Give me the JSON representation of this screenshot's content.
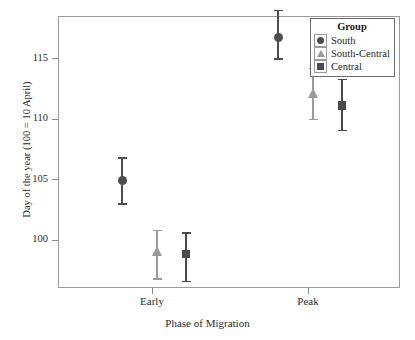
{
  "chart_data": {
    "type": "scatter",
    "title": "",
    "xlabel": "Phase of Migration",
    "ylabel": "Day of the year (100 = 10 April)",
    "categories": [
      "Early",
      "Peak"
    ],
    "xtick_labels": [
      "Early",
      "Peak"
    ],
    "ytick_labels": [
      "100",
      "105",
      "110",
      "115"
    ],
    "yticks": [
      100,
      105,
      110,
      115
    ],
    "ylim": [
      96.0,
      118.5
    ],
    "grid": false,
    "legend_position": "top-right",
    "legend_title": "Group",
    "series": [
      {
        "name": "South",
        "marker": "circle",
        "color": "#4d4d4d",
        "values": [
          104.9,
          116.7
        ],
        "err_low": [
          103.0,
          115.0
        ],
        "err_high": [
          106.8,
          119.0
        ]
      },
      {
        "name": "South-Central",
        "marker": "triangle",
        "color": "#9a9a9a",
        "values": [
          99.1,
          112.1
        ],
        "err_low": [
          96.8,
          110.0
        ],
        "err_high": [
          100.8,
          114.2
        ]
      },
      {
        "name": "Central",
        "marker": "square",
        "color": "#4a4a4a",
        "values": [
          98.8,
          111.1
        ],
        "err_low": [
          96.6,
          109.1
        ],
        "err_high": [
          100.6,
          113.3
        ]
      }
    ]
  },
  "legend": {
    "title": "Group",
    "items": [
      {
        "label": "South",
        "marker": "circle",
        "color": "#4d4d4d"
      },
      {
        "label": "South-Central",
        "marker": "triangle",
        "color": "#9a9a9a"
      },
      {
        "label": "Central",
        "marker": "square",
        "color": "#4a4a4a"
      }
    ]
  },
  "axes": {
    "x_title": "Phase of Migration",
    "y_title": "Day of the year (100 = 10 April)"
  },
  "colors": {
    "frame": "#9a9a9a",
    "text": "#2b2b2b",
    "south": "#4d4d4d",
    "south_central": "#9a9a9a",
    "central": "#4a4a4a"
  }
}
